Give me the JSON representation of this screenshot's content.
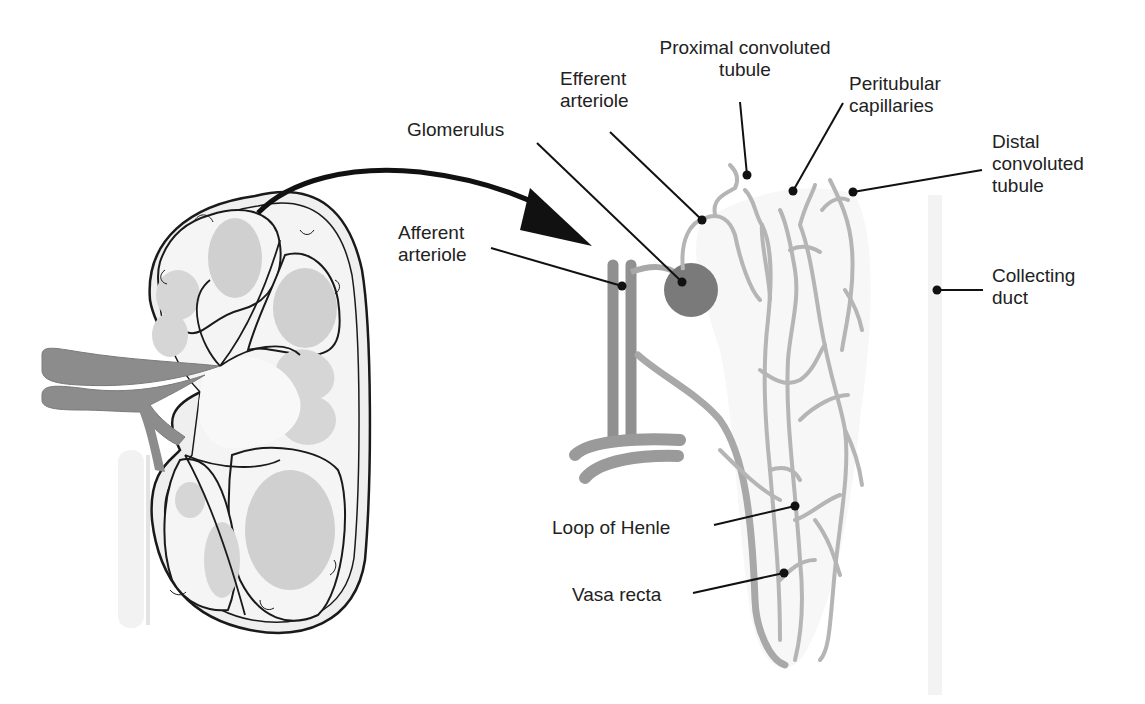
{
  "diagram": {
    "colors": {
      "outline": "#1a1a1a",
      "vessel_dark": "#8c8c8c",
      "vessel_light": "#b5b5b5",
      "tissue_fill": "#f0f0f0",
      "pyramid_fill": "#cfcfcf",
      "glomerulus": "#7a7a7a",
      "ureter": "#e6e6e6",
      "text": "#222222"
    },
    "labels": {
      "proximal_convoluted_tubule": {
        "line1": "Proximal convoluted",
        "line2": "tubule"
      },
      "efferent_arteriole": {
        "line1": "Efferent",
        "line2": "arteriole"
      },
      "glomerulus": {
        "line1": "Glomerulus"
      },
      "peritubular_capillaries": {
        "line1": "Peritubular",
        "line2": "capillaries"
      },
      "distal_convoluted_tubule": {
        "line1": "Distal",
        "line2": "convoluted",
        "line3": "tubule"
      },
      "afferent_arteriole": {
        "line1": "Afferent",
        "line2": "arteriole"
      },
      "collecting_duct": {
        "line1": "Collecting",
        "line2": "duct"
      },
      "loop_of_henle": {
        "line1": "Loop of Henle"
      },
      "vasa_recta": {
        "line1": "Vasa recta"
      }
    }
  }
}
